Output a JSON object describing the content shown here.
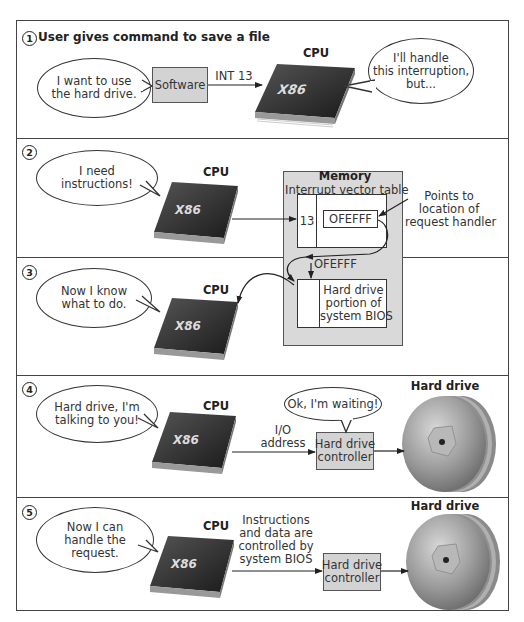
{
  "steps": [
    {
      "number": "1",
      "title": "User gives command to save a file",
      "bubble_left": "I want to use\nthe hard drive.",
      "software_label": "Software",
      "arrow_label": "INT 13",
      "cpu_label": "CPU",
      "cpu_chip_text": "X86",
      "bubble_right": "I'll handle\nthis interruption,\nbut..."
    },
    {
      "number": "2",
      "bubble": "I need\ninstructions!",
      "cpu_label": "CPU",
      "cpu_chip_text": "X86",
      "memory_label": "Memory",
      "ivt_label": "Interrupt vector table",
      "ivt_index": "13",
      "ivt_value": "OFEFFF",
      "annotation": "Points to\nlocation of\nrequest handler"
    },
    {
      "number": "3",
      "bubble": "Now I know\nwhat to do.",
      "cpu_label": "CPU",
      "cpu_chip_text": "X86",
      "address_label": "OFEFFF",
      "bios_label": "Hard drive\nportion of\nsystem BIOS"
    },
    {
      "number": "4",
      "bubble": "Hard drive, I'm\ntalking to you!",
      "cpu_label": "CPU",
      "cpu_chip_text": "X86",
      "arrow_label": "I/O\naddress",
      "controller_label": "Hard drive\ncontroller",
      "controller_bubble": "Ok, I'm waiting!",
      "drive_label": "Hard drive"
    },
    {
      "number": "5",
      "bubble": "Now I can\nhandle the\nrequest.",
      "cpu_label": "CPU",
      "cpu_chip_text": "X86",
      "arrow_label": "Instructions\nand data are\ncontrolled by\nsystem BIOS",
      "controller_label": "Hard drive\ncontroller",
      "drive_label": "Hard drive"
    }
  ],
  "colors": {
    "box_gray": "#d3d3d3",
    "memory_gray": "#d9d9d9",
    "border": "#444444",
    "chip_dark": "#2a2a2a"
  }
}
